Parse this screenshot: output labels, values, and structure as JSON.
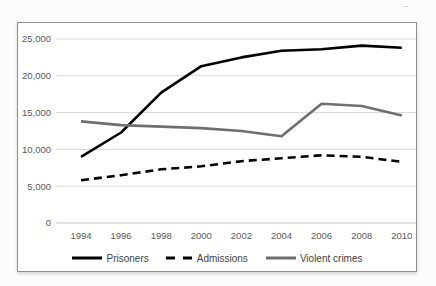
{
  "chart_data": {
    "type": "line",
    "title": "",
    "x": [
      1994,
      1996,
      1998,
      2000,
      2002,
      2004,
      2006,
      2008,
      2010
    ],
    "xticklabels": [
      "1994",
      "1996",
      "1998",
      "2000",
      "2002",
      "2004",
      "2006",
      "2008",
      "2010"
    ],
    "series": [
      {
        "name": "Prisoners",
        "values": [
          9000,
          12300,
          17700,
          21300,
          22500,
          23400,
          23600,
          24100,
          23800
        ],
        "color": "#000000",
        "line_style": "solid"
      },
      {
        "name": "Admissions",
        "values": [
          5800,
          6500,
          7300,
          7700,
          8400,
          8800,
          9200,
          9000,
          8300
        ],
        "color": "#000000",
        "line_style": "dashed"
      },
      {
        "name": "Violent crimes",
        "values": [
          13800,
          13300,
          13100,
          12900,
          12500,
          11800,
          16200,
          15900,
          14600
        ],
        "color": "#6f6f6f",
        "line_style": "solid"
      }
    ],
    "ylim": [
      0,
      25000
    ],
    "ytick_step": 5000,
    "yticklabels": [
      "0",
      "5,000",
      "10,000",
      "15,000",
      "20,000",
      "25,000"
    ],
    "grid": "horizontal-only",
    "legend_position": "bottom",
    "axis_label_color": "#595959",
    "gridline_color": "#d9d9d9",
    "zero_line_color": "#c6c6c6"
  },
  "artifacts": {
    "mark1": "~",
    "mark2": "~"
  }
}
